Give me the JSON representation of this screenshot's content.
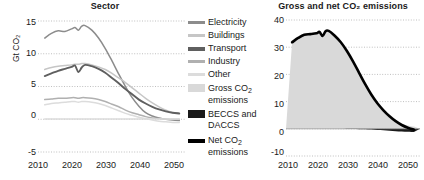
{
  "figure": {
    "background": "#ffffff",
    "text_color": "#1a1a1a"
  },
  "colors": {
    "electricity": "#8c8c8c",
    "buildings": "#c6c6c6",
    "transport": "#5f5f5f",
    "industry": "#b0b0b0",
    "other": "#dcdcdc",
    "gross_fill": "#d9d9d9",
    "beccs_fill": "#1a1a1a",
    "net_line": "#000000",
    "gridline": "#bfbfbf"
  },
  "legend": {
    "items": [
      {
        "label": "Electricity",
        "marker": "line",
        "color": "#8c8c8c"
      },
      {
        "label": "Buildings",
        "marker": "line",
        "color": "#c6c6c6"
      },
      {
        "label": "Transport",
        "marker": "line",
        "color": "#5f5f5f"
      },
      {
        "label": "Industry",
        "marker": "line",
        "color": "#b0b0b0"
      },
      {
        "label": "Other",
        "marker": "line",
        "color": "#dcdcdc"
      },
      {
        "label": "Gross CO",
        "label_sub": "2",
        "label_tail": " emissions",
        "marker": "box",
        "color": "#d9d9d9"
      },
      {
        "label": "BECCS and DACCS",
        "marker": "box",
        "color": "#1a1a1a"
      },
      {
        "label": "Net CO",
        "label_sub": "2",
        "label_tail": " emissions",
        "marker": "line",
        "color": "#000000"
      }
    ]
  },
  "chart_data": [
    {
      "id": "sector",
      "type": "line",
      "title": "Sector",
      "xlabel": "",
      "ylabel": "Gt CO₂",
      "xlim": [
        2008,
        2052
      ],
      "ylim": [
        -5,
        15
      ],
      "yticks": [
        15,
        10,
        5,
        0,
        -5
      ],
      "xticks": [
        2010,
        2020,
        2030,
        2040,
        2050
      ],
      "grid": true,
      "legend_position": "outside-right",
      "x": [
        2010,
        2012,
        2014,
        2016,
        2018,
        2019,
        2020,
        2021,
        2022,
        2024,
        2026,
        2028,
        2030,
        2032,
        2034,
        2036,
        2038,
        2040,
        2042,
        2044,
        2046,
        2048,
        2050
      ],
      "series": [
        {
          "name": "Electricity",
          "color": "#8c8c8c",
          "values": [
            12.4,
            13.1,
            13.5,
            13.4,
            13.8,
            14.0,
            13.6,
            14.2,
            14.3,
            13.6,
            12.4,
            10.8,
            8.9,
            6.9,
            5.0,
            3.3,
            2.0,
            1.0,
            0.5,
            0.2,
            0.0,
            -0.1,
            -0.2
          ]
        },
        {
          "name": "Buildings",
          "color": "#c6c6c6",
          "values": [
            7.6,
            7.9,
            8.1,
            8.2,
            8.3,
            8.4,
            8.4,
            8.5,
            8.5,
            8.3,
            8.0,
            7.6,
            7.0,
            6.3,
            5.6,
            4.8,
            4.0,
            3.2,
            2.5,
            1.9,
            1.4,
            1.0,
            0.8
          ]
        },
        {
          "name": "Transport",
          "color": "#5f5f5f",
          "values": [
            6.6,
            7.0,
            7.4,
            7.7,
            8.0,
            8.2,
            7.2,
            7.9,
            8.3,
            8.1,
            7.7,
            7.1,
            6.3,
            5.5,
            4.6,
            3.8,
            3.0,
            2.4,
            1.9,
            1.5,
            1.2,
            1.0,
            0.9
          ]
        },
        {
          "name": "Industry",
          "color": "#b0b0b0",
          "values": [
            3.0,
            3.1,
            3.2,
            3.2,
            3.3,
            3.3,
            3.2,
            3.3,
            3.3,
            3.2,
            3.0,
            2.7,
            2.3,
            1.9,
            1.4,
            1.0,
            0.7,
            0.4,
            0.2,
            0.1,
            0.0,
            0.0,
            0.0
          ]
        },
        {
          "name": "Other",
          "color": "#dcdcdc",
          "values": [
            2.2,
            2.4,
            2.5,
            2.6,
            2.7,
            2.7,
            2.6,
            2.7,
            2.7,
            2.6,
            2.4,
            2.1,
            1.7,
            1.3,
            0.9,
            0.6,
            0.3,
            0.1,
            -0.1,
            -0.3,
            -0.4,
            -0.5,
            -0.5
          ]
        },
        {
          "name": "Zero baseline series",
          "color": "#dcdcdc",
          "values": [
            0.05,
            0.05,
            0.05,
            0.05,
            0.05,
            0.05,
            0.05,
            0.05,
            0.05,
            0.05,
            0.05,
            0.05,
            0.05,
            0.05,
            0.05,
            0.05,
            0.05,
            0.05,
            0.05,
            0.05,
            0.05,
            0.05,
            0.05
          ]
        }
      ]
    },
    {
      "id": "gross_net",
      "type": "area",
      "title": "Gross and net CO₂ emissions",
      "xlabel": "",
      "ylabel": "",
      "xlim": [
        2008,
        2052
      ],
      "ylim": [
        -10,
        40
      ],
      "yticks": [
        40,
        30,
        20,
        10,
        0,
        -10
      ],
      "xticks": [
        2010,
        2020,
        2030,
        2040,
        2050
      ],
      "grid": true,
      "legend_position": "outside-left",
      "x": [
        2010,
        2012,
        2014,
        2016,
        2018,
        2019,
        2020,
        2021,
        2022,
        2024,
        2026,
        2028,
        2030,
        2032,
        2034,
        2036,
        2038,
        2040,
        2042,
        2044,
        2046,
        2048,
        2050
      ],
      "series": [
        {
          "name": "Gross CO2 emissions",
          "color": "#d9d9d9",
          "values": [
            31.8,
            33.4,
            34.6,
            34.8,
            35.1,
            35.6,
            34.1,
            35.9,
            36.0,
            34.2,
            31.8,
            28.6,
            24.8,
            20.6,
            16.4,
            12.6,
            9.4,
            6.8,
            4.6,
            3.0,
            1.9,
            1.2,
            0.8
          ]
        },
        {
          "name": "Net CO2 emissions",
          "color": "#000000",
          "values": [
            31.8,
            33.4,
            34.6,
            34.8,
            35.1,
            35.6,
            34.1,
            35.9,
            36.0,
            34.2,
            31.8,
            28.6,
            24.8,
            20.6,
            16.4,
            12.6,
            9.4,
            6.8,
            4.6,
            2.8,
            1.4,
            0.4,
            -0.3
          ]
        },
        {
          "name": "BECCS and DACCS",
          "color": "#1a1a1a",
          "values": [
            0.0,
            0.0,
            0.0,
            0.0,
            0.0,
            0.0,
            0.0,
            0.0,
            0.0,
            0.0,
            0.0,
            -0.05,
            -0.1,
            -0.15,
            -0.2,
            -0.3,
            -0.4,
            -0.5,
            -0.7,
            -0.9,
            -1.0,
            -1.1,
            -1.2
          ]
        }
      ]
    }
  ]
}
